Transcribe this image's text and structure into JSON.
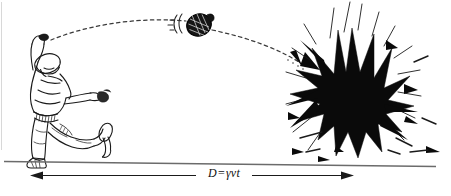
{
  "figure": {
    "caption_label": "D = γvt",
    "distance_symbol": "D",
    "equals_sign": "=",
    "gamma_symbol": "γ",
    "velocity_symbol": "v",
    "time_symbol": "t",
    "background_color": "#ffffff",
    "ink_color": "#111111",
    "explosion_color": "#0a0a0a",
    "line_color": "#6b6b6b"
  },
  "elements": {
    "thrower_name": "thrower-figure",
    "grenade_name": "grenade-projectile",
    "trajectory_name": "dashed-trajectory-arc",
    "explosion_name": "explosion-burst",
    "ground_name": "ground-line",
    "dimension_name": "distance-dimension-arrow"
  },
  "annotations": {
    "motion_lines": "speed-lines",
    "arrowhead_left": "left-arrowhead",
    "arrowhead_right": "right-arrowhead",
    "impact_arrowhead": "trajectory-impact-arrowhead"
  }
}
